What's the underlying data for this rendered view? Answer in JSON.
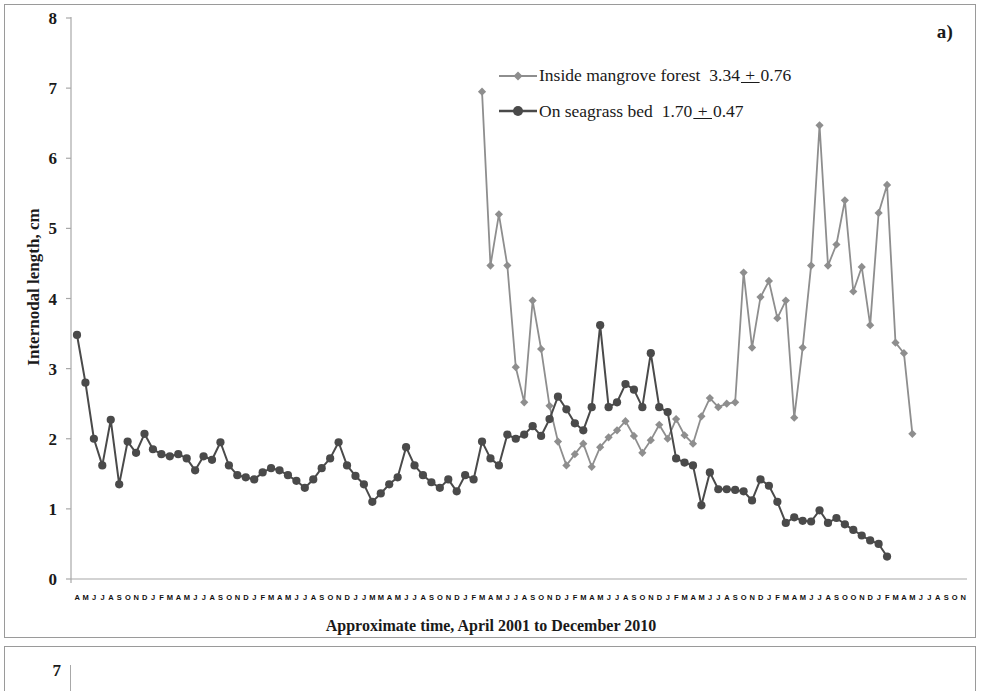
{
  "figure": {
    "panel_label": "a)",
    "second_panel_ytick": "7"
  },
  "chart_data": {
    "type": "line",
    "title": "",
    "xlabel": "Approximate time, April 2001 to December 2010",
    "ylabel": "Internodal length, cm",
    "ylim": [
      0,
      8
    ],
    "yticks": [
      "0",
      "1",
      "2",
      "3",
      "4",
      "5",
      "6",
      "7",
      "8"
    ],
    "grid": false,
    "legend_position": "top-center-right",
    "xtick_labels": [
      "A",
      "M",
      "J",
      "J",
      "A",
      "S",
      "O",
      "N",
      "D",
      "J",
      "F",
      "M",
      "A",
      "M",
      "J",
      "J",
      "A",
      "S",
      "O",
      "N",
      "D",
      "J",
      "F",
      "M",
      "A",
      "M",
      "J",
      "J",
      "A",
      "S",
      "O",
      "N",
      "D",
      "J",
      "J",
      "M",
      "M",
      "A",
      "M",
      "J",
      "J",
      "A",
      "S",
      "O",
      "N",
      "D",
      "J",
      "F",
      "M",
      "A",
      "M",
      "J",
      "J",
      "A",
      "S",
      "O",
      "N",
      "D",
      "J",
      "F",
      "M",
      "A",
      "M",
      "J",
      "J",
      "A",
      "S",
      "O",
      "N",
      "D",
      "J",
      "F",
      "M",
      "A",
      "M",
      "J",
      "J",
      "A",
      "S",
      "O",
      "N",
      "D",
      "J",
      "F",
      "M",
      "A",
      "M",
      "J",
      "J",
      "A",
      "S",
      "O",
      "O",
      "N",
      "D",
      "J",
      "F",
      "M",
      "A",
      "M",
      "J",
      "J",
      "A",
      "S",
      "O",
      "N"
    ],
    "series": [
      {
        "name": "Inside mangrove forest",
        "stat_mean": "3.34",
        "stat_sd": "0.76",
        "stat_text": "3.34 + 0.76",
        "color": "#8e8e8e",
        "marker": "diamond",
        "start_index": 48,
        "values": [
          6.95,
          4.47,
          5.2,
          4.47,
          3.02,
          2.52,
          3.97,
          3.28,
          2.47,
          1.96,
          1.62,
          1.78,
          1.93,
          1.6,
          1.88,
          2.02,
          2.12,
          2.25,
          2.04,
          1.8,
          1.98,
          2.2,
          2.0,
          2.28,
          2.05,
          1.93,
          2.32,
          2.58,
          2.45,
          2.5,
          2.52,
          4.37,
          3.3,
          4.02,
          4.25,
          3.72,
          3.97,
          2.3,
          3.3,
          4.47,
          6.47,
          4.47,
          4.77,
          5.4,
          4.1,
          4.45,
          3.62,
          5.22,
          5.62,
          3.37,
          3.22,
          2.07
        ]
      },
      {
        "name": "On seagrass bed",
        "stat_mean": "1.70",
        "stat_sd": "0.47",
        "stat_text": "1.70 + 0.47",
        "color": "#4a4a4a",
        "marker": "circle",
        "start_index": 0,
        "values": [
          3.48,
          2.8,
          2.0,
          1.62,
          2.27,
          1.35,
          1.96,
          1.8,
          2.07,
          1.85,
          1.78,
          1.75,
          1.78,
          1.72,
          1.55,
          1.75,
          1.7,
          1.95,
          1.62,
          1.48,
          1.45,
          1.42,
          1.52,
          1.58,
          1.55,
          1.48,
          1.4,
          1.3,
          1.42,
          1.58,
          1.72,
          1.95,
          1.62,
          1.47,
          1.35,
          1.1,
          1.22,
          1.35,
          1.45,
          1.88,
          1.62,
          1.48,
          1.38,
          1.3,
          1.42,
          1.25,
          1.48,
          1.42,
          1.96,
          1.72,
          1.62,
          2.06,
          2.0,
          2.06,
          2.18,
          2.04,
          2.28,
          2.6,
          2.42,
          2.22,
          2.12,
          2.45,
          3.62,
          2.45,
          2.52,
          2.78,
          2.7,
          2.45,
          3.22,
          2.45,
          2.38,
          1.72,
          1.66,
          1.62,
          1.05,
          1.52,
          1.28,
          1.28,
          1.27,
          1.25,
          1.12,
          1.42,
          1.33,
          1.1,
          0.8,
          0.88,
          0.83,
          0.82,
          0.98,
          0.8,
          0.87,
          0.78,
          0.7,
          0.62,
          0.55,
          0.5,
          0.32
        ]
      }
    ]
  }
}
